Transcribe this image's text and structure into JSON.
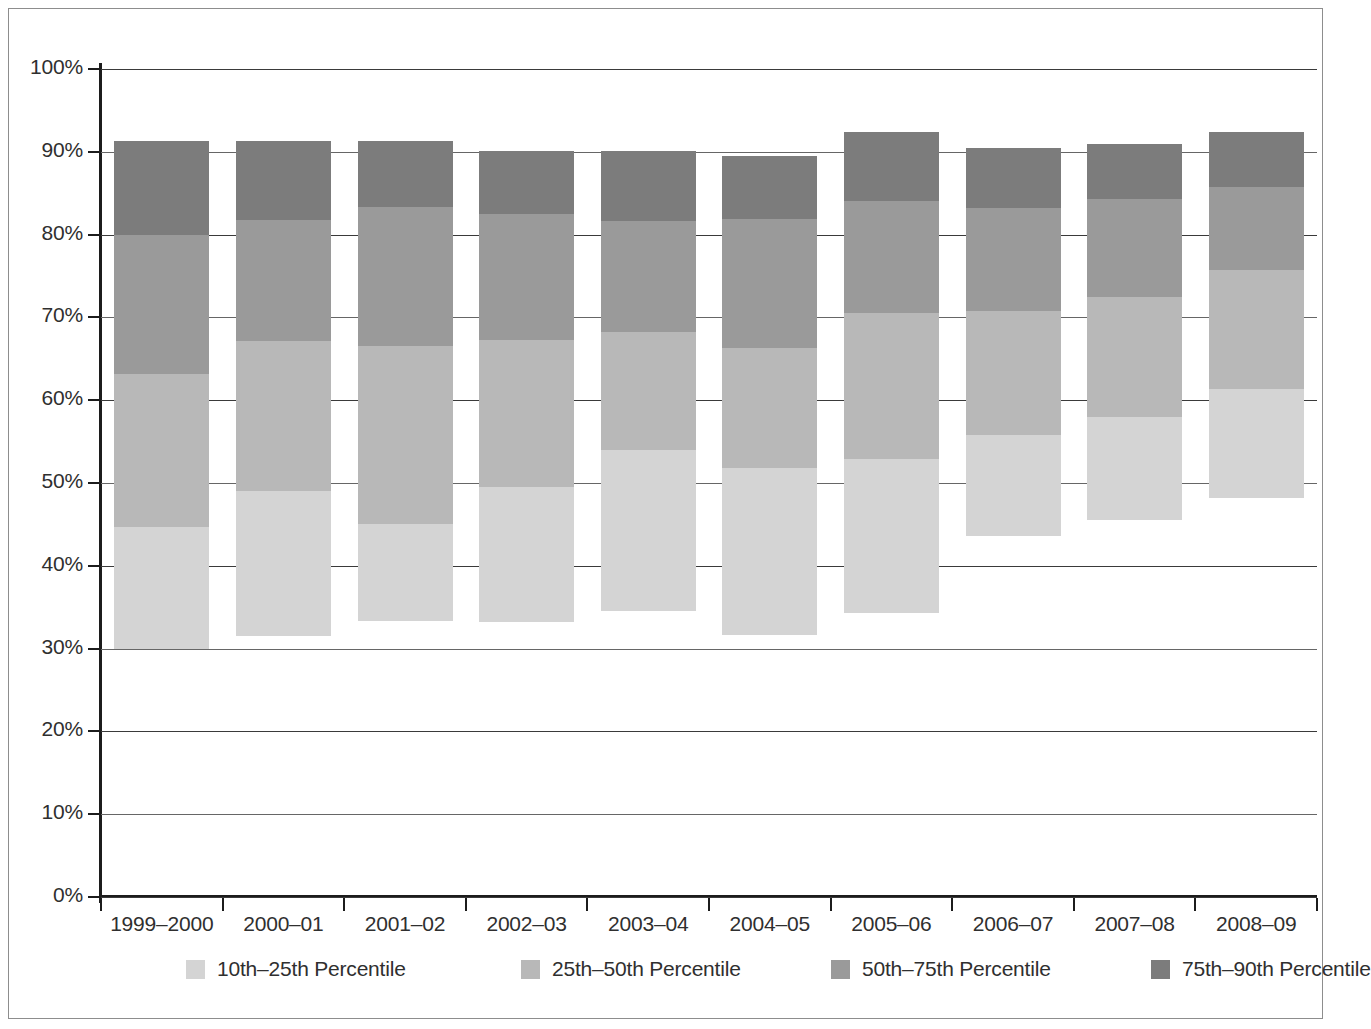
{
  "chart_data": {
    "type": "bar",
    "subtype": "stacked-bar",
    "title": "",
    "subtitle": "",
    "xlabel": "",
    "ylabel": "",
    "ylim": [
      0,
      100
    ],
    "y_tick_labels": [
      "0%",
      "10%",
      "20%",
      "30%",
      "40%",
      "50%",
      "60%",
      "70%",
      "80%",
      "90%",
      "100%"
    ],
    "y_tick_values": [
      0,
      10,
      20,
      30,
      40,
      50,
      60,
      70,
      80,
      90,
      100
    ],
    "grid": true,
    "legend_position": "bottom",
    "categories": [
      "1999–2000",
      "2000–01",
      "2001–02",
      "2002–03",
      "2003–04",
      "2004–05",
      "2005–06",
      "2006–07",
      "2007–08",
      "2008–09"
    ],
    "series": [
      {
        "name": "10th–25th Percentile",
        "color": "#d4d4d4",
        "bottoms": [
          30.0,
          31.5,
          33.3,
          33.2,
          34.6,
          31.6,
          34.3,
          43.6,
          45.5,
          48.2
        ],
        "tops": [
          44.7,
          49.0,
          45.1,
          49.5,
          54.0,
          51.8,
          52.9,
          55.8,
          58.0,
          61.3
        ],
        "values": [
          14.7,
          17.5,
          11.8,
          16.3,
          19.4,
          20.2,
          18.6,
          12.2,
          12.5,
          13.1
        ]
      },
      {
        "name": "25th–50th Percentile",
        "color": "#b8b8b8",
        "bottoms": [
          44.7,
          49.0,
          45.1,
          49.5,
          54.0,
          51.8,
          52.9,
          55.8,
          58.0,
          61.3
        ],
        "tops": [
          63.2,
          67.2,
          66.5,
          67.3,
          68.2,
          66.3,
          70.5,
          70.8,
          72.5,
          75.7
        ],
        "values": [
          18.5,
          18.2,
          21.4,
          17.8,
          14.2,
          14.5,
          17.6,
          15.0,
          14.5,
          14.4
        ]
      },
      {
        "name": "50th–75th Percentile",
        "color": "#9a9a9a",
        "bottoms": [
          63.2,
          67.2,
          66.5,
          67.3,
          68.2,
          66.3,
          70.5,
          70.8,
          72.5,
          75.7
        ],
        "tops": [
          80.0,
          81.8,
          83.3,
          82.5,
          81.6,
          81.9,
          84.0,
          83.2,
          84.3,
          85.8
        ],
        "values": [
          16.8,
          14.6,
          16.8,
          15.2,
          13.4,
          15.6,
          13.5,
          12.4,
          11.8,
          10.1
        ]
      },
      {
        "name": "75th–90th Percentile",
        "color": "#7c7c7c",
        "bottoms": [
          80.0,
          81.8,
          83.3,
          82.5,
          81.6,
          81.9,
          84.0,
          83.2,
          84.3,
          85.8
        ],
        "tops": [
          91.3,
          91.3,
          91.3,
          90.1,
          90.1,
          89.5,
          92.4,
          90.4,
          91.0,
          92.4
        ],
        "values": [
          11.3,
          9.5,
          8.0,
          7.6,
          8.5,
          7.6,
          8.4,
          7.2,
          6.7,
          6.6
        ]
      }
    ]
  },
  "legend": {
    "items": [
      {
        "label": "10th–25th Percentile",
        "color": "#d4d4d4"
      },
      {
        "label": "25th–50th Percentile",
        "color": "#b8b8b8"
      },
      {
        "label": "50th–75th Percentile",
        "color": "#9a9a9a"
      },
      {
        "label": "75th–90th Percentile",
        "color": "#7c7c7c"
      }
    ]
  },
  "style": {
    "frame_color": "#8d8d8d",
    "axis_color": "#1c1c1c",
    "gridline_color": "#3a3a3a",
    "text_color": "#2f2f2f",
    "background": "#ffffff"
  }
}
